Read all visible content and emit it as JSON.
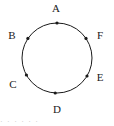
{
  "figure": {
    "type": "circle-with-labeled-points",
    "background_color": "#ffffff",
    "stroke_color": "#1a1a1a",
    "label_color": "#1a1a1a",
    "circle": {
      "center_x": 57,
      "center_y": 58,
      "radius": 35,
      "stroke_width": 1
    },
    "points": [
      {
        "id": "A",
        "label": "A",
        "angle_deg": 95,
        "marker_x": 57.0,
        "marker_y": 23.0,
        "label_x": 56,
        "label_y": 9,
        "dot_radius": 1.6
      },
      {
        "id": "B",
        "label": "B",
        "angle_deg": 146,
        "marker_x": 27.9,
        "marker_y": 38.4,
        "label_x": 12,
        "label_y": 36,
        "dot_radius": 1.6
      },
      {
        "id": "C",
        "label": "C",
        "angle_deg": 209,
        "marker_x": 26.4,
        "marker_y": 75.0,
        "label_x": 13,
        "label_y": 85,
        "dot_radius": 1.6
      },
      {
        "id": "D",
        "label": "D",
        "angle_deg": 267,
        "marker_x": 55.2,
        "marker_y": 93.0,
        "label_x": 57,
        "label_y": 110,
        "dot_radius": 1.6
      },
      {
        "id": "E",
        "label": "E",
        "angle_deg": 329,
        "marker_x": 87.0,
        "marker_y": 76.0,
        "label_x": 100,
        "label_y": 78,
        "dot_radius": 1.6
      },
      {
        "id": "F",
        "label": "F",
        "angle_deg": 34,
        "marker_x": 86.0,
        "marker_y": 38.4,
        "label_x": 100,
        "label_y": 36,
        "dot_radius": 1.6
      }
    ]
  },
  "footer": {
    "clipped_text": "· · · · · ·",
    "visible": true
  }
}
